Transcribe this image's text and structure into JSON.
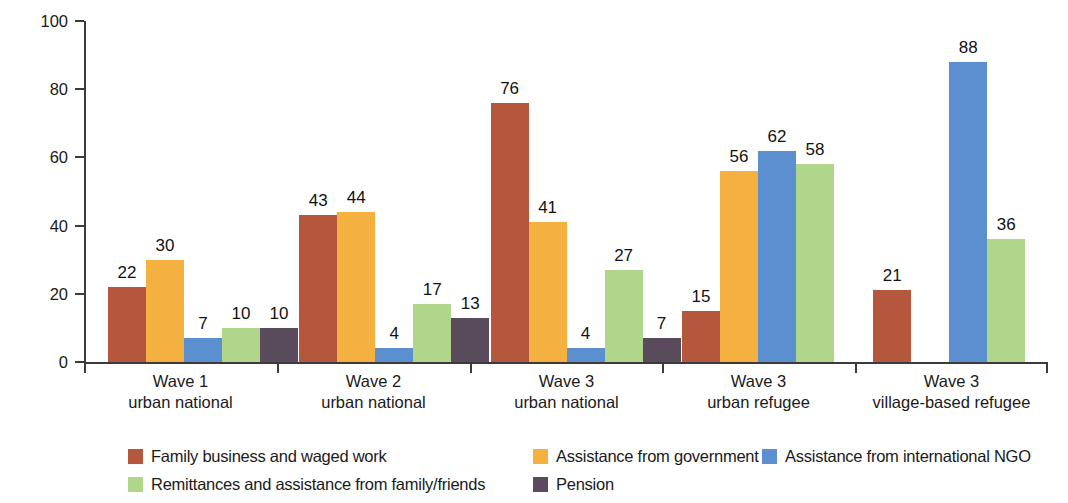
{
  "chart_data": {
    "type": "bar",
    "title": "",
    "xlabel": "",
    "ylabel": "Share of households (%)",
    "ylim": [
      0,
      100
    ],
    "yticks": [
      0,
      20,
      40,
      60,
      80,
      100
    ],
    "grid": false,
    "legend_position": "bottom",
    "categories": [
      {
        "line1": "Wave 1",
        "line2": "urban national"
      },
      {
        "line1": "Wave 2",
        "line2": "urban national"
      },
      {
        "line1": "Wave 3",
        "line2": "urban national"
      },
      {
        "line1": "Wave 3",
        "line2": "urban refugee"
      },
      {
        "line1": "Wave 3",
        "line2": "village-based refugee"
      }
    ],
    "series": [
      {
        "name": "Family business and waged work",
        "color": "#b4573c",
        "values": [
          22,
          43,
          76,
          15,
          21
        ]
      },
      {
        "name": "Assistance from government",
        "color": "#f5b13f",
        "values": [
          30,
          44,
          41,
          56,
          null
        ]
      },
      {
        "name": "Assistance from international NGO",
        "color": "#5b8fd0",
        "values": [
          7,
          4,
          4,
          62,
          88
        ]
      },
      {
        "name": "Remittances and assistance from family/friends",
        "color": "#afd68a",
        "values": [
          10,
          17,
          27,
          58,
          36
        ]
      },
      {
        "name": "Pension",
        "color": "#594a5c",
        "values": [
          10,
          13,
          7,
          null,
          null
        ]
      }
    ]
  },
  "axis": {
    "tick_labels": [
      "0",
      "20",
      "40",
      "60",
      "80",
      "100"
    ]
  }
}
